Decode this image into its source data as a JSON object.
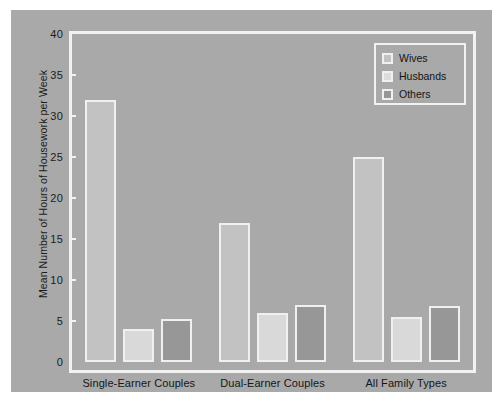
{
  "chart_data": {
    "type": "bar",
    "title": "",
    "xlabel": "",
    "ylabel": "Mean Number of Hours of Housework per Week",
    "ylim": [
      0,
      40
    ],
    "yticks": [
      0,
      5,
      10,
      15,
      20,
      25,
      30,
      35,
      40
    ],
    "grid": false,
    "legend_position": "top-right",
    "categories": [
      "Single-Earner Couples",
      "Dual-Earner Couples",
      "All Family Types"
    ],
    "series": [
      {
        "name": "Wives",
        "color": "#c2c2c2",
        "values": [
          32,
          17,
          25
        ]
      },
      {
        "name": "Husbands",
        "color": "#d9d9d9",
        "values": [
          4,
          6,
          5.5
        ]
      },
      {
        "name": "Others",
        "color": "#979797",
        "values": [
          5.2,
          7,
          6.8
        ]
      }
    ]
  },
  "figure": {
    "background_color": "#a9a9a9",
    "frame_color": "#f2f2f2",
    "page_color": "#ffffff"
  }
}
